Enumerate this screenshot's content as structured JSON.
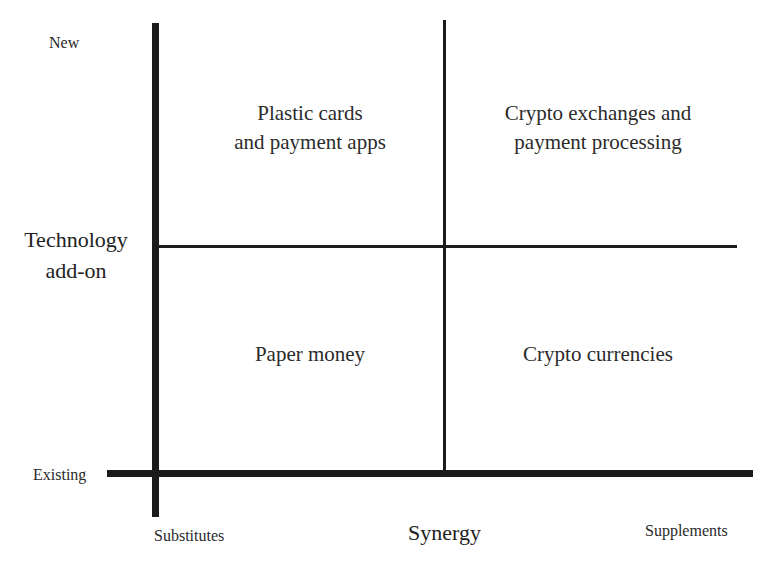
{
  "diagram": {
    "type": "2x2 matrix",
    "y_axis": {
      "title_line1": "Technology",
      "title_line2": "add-on",
      "top_label": "New",
      "bottom_label": "Existing"
    },
    "x_axis": {
      "title": "Synergy",
      "left_label": "Substitutes",
      "right_label": "Supplements"
    },
    "quadrants": {
      "top_left": {
        "line1": "Plastic cards",
        "line2": "and payment apps"
      },
      "top_right": {
        "line1": "Crypto exchanges and",
        "line2": "payment processing"
      },
      "bottom_left": {
        "line1": "Paper money"
      },
      "bottom_right": {
        "line1": "Crypto currencies"
      }
    },
    "colors": {
      "lines": "#1b1b1b",
      "text": "#2a2a2a",
      "background": "#ffffff"
    }
  }
}
